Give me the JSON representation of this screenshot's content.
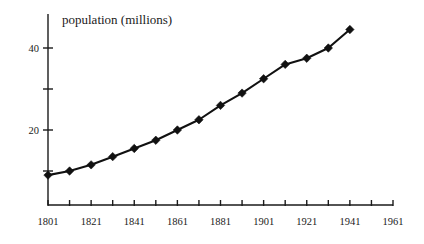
{
  "chart_data": {
    "type": "line",
    "title": "population (millions)",
    "xlabel": "",
    "ylabel": "",
    "grid": false,
    "legend": "none",
    "marker": "diamond",
    "x": [
      1801,
      1811,
      1821,
      1831,
      1841,
      1851,
      1861,
      1871,
      1881,
      1891,
      1901,
      1911,
      1921,
      1931,
      1941
    ],
    "values": [
      9,
      10,
      11.5,
      13.5,
      15.5,
      17.5,
      20,
      22.5,
      26,
      29,
      32.5,
      36,
      37.5,
      40,
      44.5
    ],
    "series": [
      {
        "name": "population",
        "values": [
          9,
          10,
          11.5,
          13.5,
          15.5,
          17.5,
          20,
          22.5,
          26,
          29,
          32.5,
          36,
          37.5,
          40,
          44.5
        ]
      }
    ],
    "xlim": [
      1801,
      1961
    ],
    "ylim": [
      0,
      47
    ],
    "x_ticks": [
      1801,
      1811,
      1821,
      1831,
      1841,
      1851,
      1861,
      1871,
      1881,
      1891,
      1901,
      1911,
      1921,
      1931,
      1941,
      1951,
      1961
    ],
    "x_tick_labels": [
      "1801",
      "",
      "1821",
      "",
      "1841",
      "",
      "1861",
      "",
      "1881",
      "",
      "1901",
      "",
      "1921",
      "",
      "1941",
      "",
      "1961"
    ],
    "x_labeled_ticks": [
      "1801",
      "1821",
      "1841",
      "1861",
      "1881",
      "1901",
      "1921",
      "1941",
      "1961"
    ],
    "y_ticks": [
      10,
      20,
      30,
      40
    ],
    "y_tick_labels": [
      "",
      "20",
      "",
      "40"
    ],
    "y_labeled_ticks": [
      "20",
      "40"
    ],
    "line_color": "#111111",
    "axis_color": "#1a1a1a",
    "background_color": "#ffffff"
  }
}
